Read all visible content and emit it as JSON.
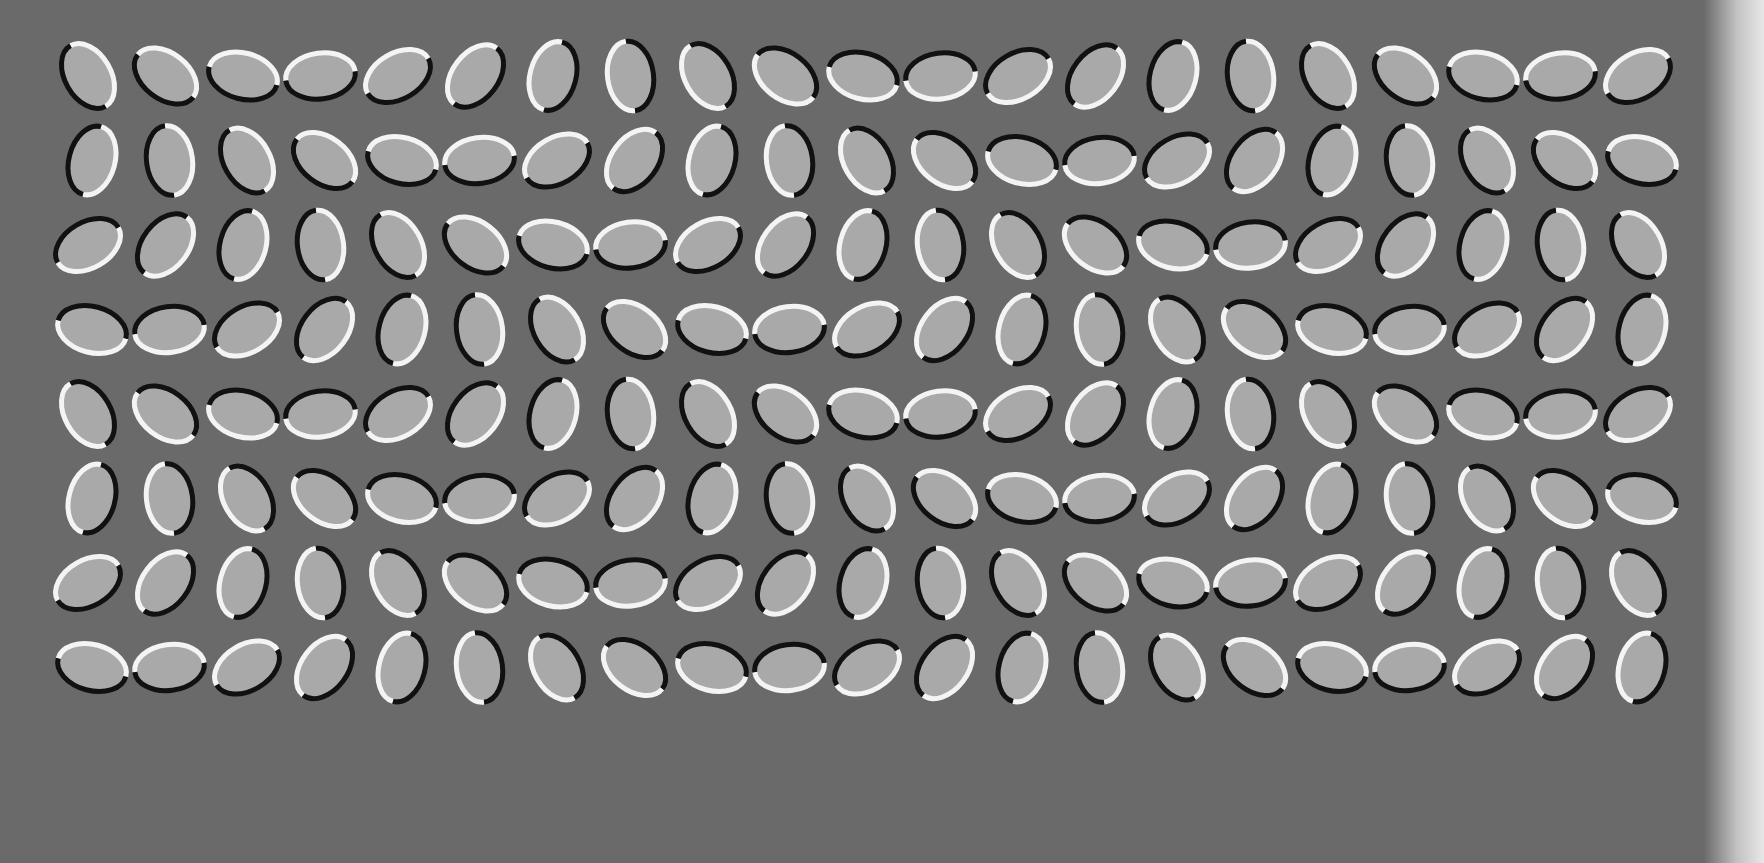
{
  "title": "Rotating ellipses optical illusion",
  "colors": {
    "background": "#6a6a6a",
    "fill": "#a9a9a9",
    "stroke_light": "#f4f4f4",
    "stroke_dark": "#111111",
    "edge": "#e8e8e8"
  },
  "grid": {
    "rows": 8,
    "cols": 21,
    "origin_x": 88,
    "origin_y": 76,
    "col_spacing": 77.5,
    "row_spacing": 84.5,
    "rx": 35,
    "ry": 23,
    "stroke_width": 5,
    "angle_step_col": -22.5,
    "angle_step_row": 45,
    "angle_start": 60
  }
}
